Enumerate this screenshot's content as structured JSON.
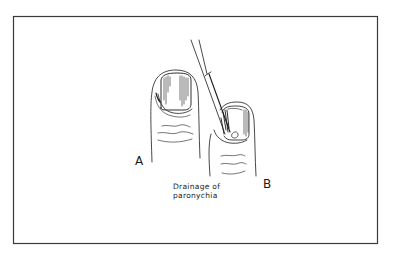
{
  "figure": {
    "labels": {
      "finger_a": "A",
      "finger_b": "B"
    },
    "caption": {
      "line1": "Drainage of",
      "line2": "paronychia"
    },
    "colors": {
      "frame": "#3a3a3a",
      "ink": "#1a1a1a",
      "background": "#ffffff"
    }
  }
}
